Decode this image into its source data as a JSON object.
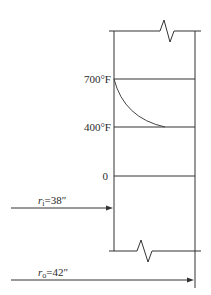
{
  "diagram": {
    "type": "pipe-wall-temperature-profile",
    "labels": {
      "temp_inner": "700°F",
      "temp_outer": "400°F",
      "zero": "0",
      "r_inner_symbol": "r",
      "r_inner_sub": "i",
      "r_inner_value": "=38″",
      "r_outer_symbol": "r",
      "r_outer_sub": "o",
      "r_outer_value": "=42″"
    },
    "colors": {
      "line": "#333333",
      "text": "#2a2a2a",
      "background": "#ffffff"
    }
  }
}
